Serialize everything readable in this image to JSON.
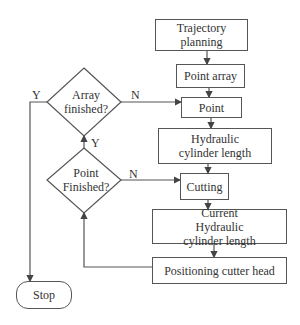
{
  "diagram": {
    "type": "flowchart",
    "nodes": {
      "trajectory_planning": "Trajectory planning",
      "point_array": "Point array",
      "point": "Point",
      "hydraulic_length": "Hydraulic cylinder length",
      "cutting": "Cutting",
      "current_hydraulic_length": "Current Hydraulic cylinder length",
      "positioning": "Positioning cutter head",
      "array_finished": "Array finished?",
      "point_finished": "Point Finished?",
      "stop": "Stop"
    },
    "edge_labels": {
      "array_yes": "Y",
      "array_no": "N",
      "point_yes": "Y",
      "point_no": "N"
    },
    "edges": [
      {
        "from": "Trajectory planning",
        "to": "Point array"
      },
      {
        "from": "Point array",
        "to": "Point"
      },
      {
        "from": "Point",
        "to": "Hydraulic cylinder length"
      },
      {
        "from": "Hydraulic cylinder length",
        "to": "Cutting"
      },
      {
        "from": "Cutting",
        "to": "Current Hydraulic cylinder length"
      },
      {
        "from": "Current Hydraulic cylinder length",
        "to": "Positioning cutter head"
      },
      {
        "from": "Positioning cutter head",
        "to": "Point Finished?"
      },
      {
        "from": "Point Finished?",
        "to": "Cutting",
        "label": "N"
      },
      {
        "from": "Point Finished?",
        "to": "Array finished?",
        "label": "Y"
      },
      {
        "from": "Array finished?",
        "to": "Point",
        "label": "N"
      },
      {
        "from": "Array finished?",
        "to": "Stop",
        "label": "Y"
      }
    ]
  }
}
